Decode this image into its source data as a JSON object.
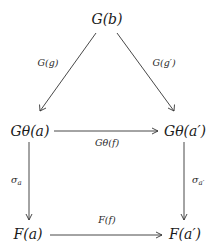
{
  "diagram": {
    "type": "commutative-diagram",
    "nodes": {
      "top": "G(b)",
      "mid_left": "Gθ(a)",
      "mid_right": "Gθ(a′)",
      "bottom_left": "F(a)",
      "bottom_right": "F(a′)"
    },
    "edges": {
      "top_to_mid_left": "G(g)",
      "top_to_mid_right": "G(g′)",
      "mid_left_to_mid_right": "Gθ(f)",
      "mid_left_to_bottom_left": "σ",
      "mid_left_to_bottom_left_sub": "a",
      "mid_right_to_bottom_right": "σ",
      "mid_right_to_bottom_right_sub": "a′",
      "bottom_left_to_bottom_right": "F(f)"
    },
    "colors": {
      "ink": "#1a1a1a",
      "arrow": "#333333",
      "background": "#ffffff"
    }
  }
}
